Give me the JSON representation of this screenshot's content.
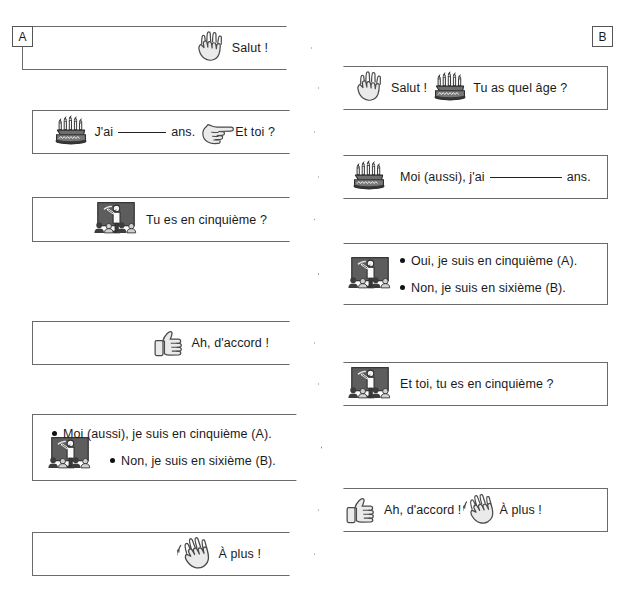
{
  "page": {
    "columns": [
      {
        "id": "A",
        "label": "A"
      },
      {
        "id": "B",
        "label": "B"
      }
    ],
    "cut_off_header": "",
    "line_color": "#6a6a6a",
    "text_color": "#1a1a1a",
    "icon_fill": "#e3e3e3",
    "icon_stroke": "#4a4a4a",
    "board_fill": "#5d5d5d"
  },
  "bubbles": [
    {
      "id": "a1",
      "column": "A",
      "direction": "right",
      "icons": [
        "raised-hand-icon"
      ],
      "text": "Salut !",
      "parts": [
        {
          "type": "icon",
          "name": "raised-hand-icon"
        },
        {
          "type": "text",
          "value": "Salut !"
        }
      ]
    },
    {
      "id": "b1",
      "column": "B",
      "direction": "left",
      "icons": [
        "raised-hand-icon",
        "birthday-cake-icon"
      ],
      "text": "Salut !  Tu as quel âge ?",
      "parts": [
        {
          "type": "icon",
          "name": "raised-hand-icon"
        },
        {
          "type": "text",
          "value": "Salut !"
        },
        {
          "type": "icon",
          "name": "birthday-cake-icon"
        },
        {
          "type": "text",
          "value": "Tu as quel âge ?"
        }
      ]
    },
    {
      "id": "a2",
      "column": "A",
      "direction": "right",
      "icons": [
        "birthday-cake-icon",
        "pointing-hand-icon"
      ],
      "text": "J'ai ______ ans.  Et toi ?",
      "parts": [
        {
          "type": "icon",
          "name": "birthday-cake-icon"
        },
        {
          "type": "text",
          "value": "J'ai"
        },
        {
          "type": "blank",
          "width": 48
        },
        {
          "type": "text",
          "value": "ans."
        },
        {
          "type": "icon",
          "name": "pointing-hand-icon"
        },
        {
          "type": "text",
          "value": "Et toi ?"
        }
      ]
    },
    {
      "id": "b2",
      "column": "B",
      "direction": "left",
      "icons": [
        "birthday-cake-icon"
      ],
      "text": "Moi (aussi), j'ai __________ ans.",
      "parts": [
        {
          "type": "icon",
          "name": "birthday-cake-icon"
        },
        {
          "type": "text",
          "value": "Moi (aussi), j'ai"
        },
        {
          "type": "blank",
          "width": 72
        },
        {
          "type": "text",
          "value": "ans."
        }
      ]
    },
    {
      "id": "a3",
      "column": "A",
      "direction": "right",
      "icons": [
        "classroom-icon"
      ],
      "text": "Tu es en cinquième ?",
      "parts": [
        {
          "type": "icon",
          "name": "classroom-icon"
        },
        {
          "type": "text",
          "value": "Tu es en cinquième ?"
        }
      ]
    },
    {
      "id": "b3",
      "column": "B",
      "direction": "left",
      "icons": [
        "classroom-icon"
      ],
      "bullets": [
        "Oui, je suis en cinquième (A).",
        "Non, je suis en sixième (B)."
      ]
    },
    {
      "id": "a4",
      "column": "A",
      "direction": "right",
      "icons": [
        "thumbs-up-icon"
      ],
      "text": "Ah, d'accord !",
      "parts": [
        {
          "type": "icon",
          "name": "thumbs-up-icon"
        },
        {
          "type": "text",
          "value": "Ah, d'accord !"
        }
      ]
    },
    {
      "id": "b4",
      "column": "B",
      "direction": "left",
      "icons": [
        "classroom-icon"
      ],
      "text": "Et toi, tu es en cinquième ?",
      "parts": [
        {
          "type": "icon",
          "name": "classroom-icon"
        },
        {
          "type": "text",
          "value": "Et toi, tu es en cinquième ?"
        }
      ]
    },
    {
      "id": "a5",
      "column": "A",
      "direction": "right",
      "icons": [
        "classroom-icon"
      ],
      "bullets": [
        "Moi (aussi), je suis en cinquième (A).",
        "Non, je suis en sixième (B)."
      ]
    },
    {
      "id": "b5",
      "column": "B",
      "direction": "left",
      "icons": [
        "thumbs-up-icon",
        "waving-hand-icon"
      ],
      "text": "Ah, d'accord !  À plus !",
      "parts": [
        {
          "type": "icon",
          "name": "thumbs-up-icon"
        },
        {
          "type": "text",
          "value": "Ah, d'accord !"
        },
        {
          "type": "icon",
          "name": "waving-hand-icon"
        },
        {
          "type": "text",
          "value": "À plus !"
        }
      ]
    },
    {
      "id": "a6",
      "column": "A",
      "direction": "right",
      "icons": [
        "waving-hand-icon"
      ],
      "text": "À plus !",
      "parts": [
        {
          "type": "icon",
          "name": "waving-hand-icon"
        },
        {
          "type": "text",
          "value": "À plus !"
        }
      ]
    }
  ]
}
